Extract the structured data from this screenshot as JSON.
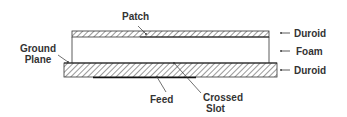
{
  "diagram": {
    "type": "cross-section",
    "labels": {
      "patch": "Patch",
      "ground_plane_line1": "Ground",
      "ground_plane_line2": "Plane",
      "feed": "Feed",
      "crossed_slot_line1": "Crossed",
      "crossed_slot_line2": "Slot",
      "top_layer": "Duroid",
      "middle_layer": "Foam",
      "bottom_layer": "Duroid"
    },
    "layers": [
      {
        "name": "Duroid",
        "position": "top",
        "fill": "hatched"
      },
      {
        "name": "Foam",
        "position": "middle",
        "fill": "empty"
      },
      {
        "name": "Duroid",
        "position": "bottom",
        "fill": "hatched"
      }
    ],
    "colors": {
      "stroke": "#333333",
      "hatch": "#555555",
      "background": "#ffffff"
    }
  }
}
